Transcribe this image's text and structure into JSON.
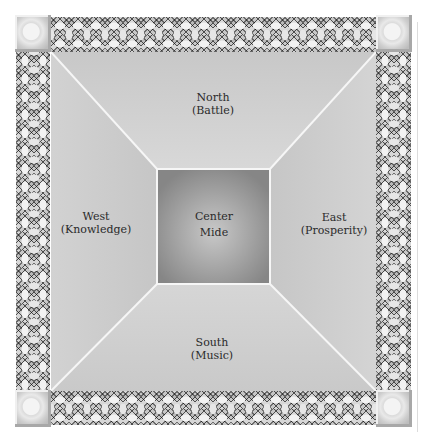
{
  "diagram": {
    "type": "five-province cosmological layout",
    "regions": {
      "north": {
        "name": "North",
        "attribute": "(Battle)"
      },
      "west": {
        "name": "West",
        "attribute": "(Knowledge)"
      },
      "center": {
        "name": "Center",
        "attribute": "Mide"
      },
      "east": {
        "name": "East",
        "attribute": "(Prosperity)"
      },
      "south": {
        "name": "South",
        "attribute": "(Music)"
      }
    },
    "border": {
      "style": "celtic-knotwork",
      "corners": [
        "top-left",
        "top-right",
        "bottom-left",
        "bottom-right"
      ]
    },
    "colors": {
      "outer_field": "#cfcfcf",
      "center_dark": "#8a8a8a",
      "center_light": "#c4c4c4",
      "divider_lines": "#f4f4f4"
    }
  }
}
